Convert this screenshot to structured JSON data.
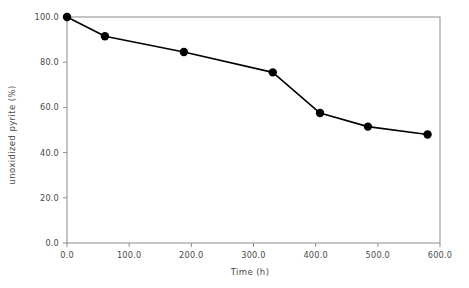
{
  "chart_data": {
    "type": "line",
    "title": "",
    "xlabel": "Time (h)",
    "ylabel": "unoxidized pyrite (%)",
    "xlim": [
      0,
      600
    ],
    "ylim": [
      0,
      100
    ],
    "xticks": [
      "0.0",
      "100.0",
      "200.0",
      "300.0",
      "400.0",
      "500.0",
      "600.0"
    ],
    "yticks": [
      "0.0",
      "20.0",
      "40.0",
      "60.0",
      "80.0",
      "100.0"
    ],
    "xtick_values": [
      0,
      100,
      200,
      300,
      400,
      500,
      600
    ],
    "ytick_values": [
      0,
      20,
      40,
      60,
      80,
      100
    ],
    "grid": false,
    "legend": null,
    "series": [
      {
        "name": "unoxidized pyrite",
        "marker": "filled-circle",
        "color": "#000000",
        "x": [
          0,
          61,
          188,
          331,
          407,
          484,
          580
        ],
        "y": [
          100.0,
          91.5,
          84.5,
          75.5,
          57.5,
          51.5,
          48.0
        ]
      }
    ]
  },
  "axes": {
    "y_title": "unoxidized pyrite (%)",
    "x_title": "Time (h)"
  },
  "style": {
    "frame_color": "#808080",
    "line_color": "#000000",
    "marker_color": "#000000",
    "background": "#ffffff",
    "text_color": "#4a4a4a"
  }
}
